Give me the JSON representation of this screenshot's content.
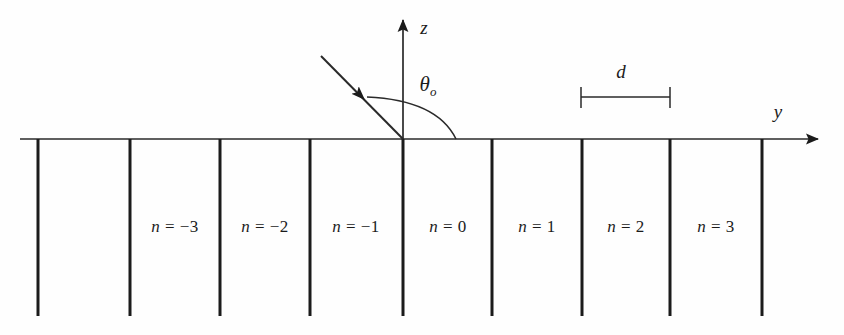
{
  "figure": {
    "background_color": "#fefefe",
    "line_color": "#1b1b1b",
    "axis_color": "#2a2a2a"
  },
  "axes": {
    "horizontal": {
      "label": "y",
      "label_x": 778,
      "label_y": 112,
      "y": 139,
      "x_start": 20,
      "x_end": 824
    },
    "vertical": {
      "label": "z",
      "label_x": 424,
      "label_y": 28,
      "x": 403,
      "y_top": 12,
      "y_bottom": 139
    }
  },
  "incident_ray": {
    "name": "incident-beam",
    "start_x": 321,
    "start_y": 56,
    "end_x": 403,
    "end_y": 139,
    "arrow_tip_x": 359,
    "arrow_tip_y": 94
  },
  "angle": {
    "label": "θ",
    "subscript": "o",
    "label_x": 428,
    "label_y": 86,
    "arc_start_x": 367,
    "arc_start_y": 97,
    "arc_end_x": 456,
    "arc_end_y": 139
  },
  "period_marker": {
    "label": "d",
    "label_x": 621,
    "label_y": 72,
    "line_y": 97,
    "x_left": 581,
    "x_right": 670,
    "tick_top": 87,
    "tick_bottom": 108
  },
  "grating": {
    "line_top": 139,
    "line_bottom": 316,
    "line_width": 3,
    "positions": [
      38,
      130,
      220,
      310,
      403,
      492,
      582,
      670,
      762
    ]
  },
  "orders": [
    {
      "label_n": "n",
      "eq": "=",
      "value": "−3",
      "x": 175,
      "y": 227
    },
    {
      "label_n": "n",
      "eq": "=",
      "value": "−2",
      "x": 265,
      "y": 227
    },
    {
      "label_n": "n",
      "eq": "=",
      "value": "−1",
      "x": 356,
      "y": 227
    },
    {
      "label_n": "n",
      "eq": "=",
      "value": "0",
      "x": 448,
      "y": 227
    },
    {
      "label_n": "n",
      "eq": "=",
      "value": "1",
      "x": 537,
      "y": 227
    },
    {
      "label_n": "n",
      "eq": "=",
      "value": "2",
      "x": 626,
      "y": 227
    },
    {
      "label_n": "n",
      "eq": "=",
      "value": "3",
      "x": 716,
      "y": 227
    }
  ]
}
